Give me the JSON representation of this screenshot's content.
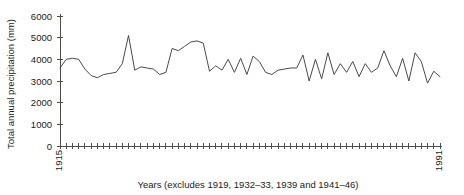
{
  "chart_data": {
    "type": "line",
    "title": "",
    "subtitle": "",
    "xlabel": "Years (excludes 1919, 1932–33, 1939 and 1941–46)",
    "ylabel": "Total annual precipitation (mm)",
    "ylim": [
      0,
      6000
    ],
    "yticks": [
      0,
      1000,
      2000,
      3000,
      4000,
      5000,
      6000
    ],
    "ytick_labels": [
      "0",
      "1000",
      "2000",
      "3000",
      "4000",
      "5000",
      "6000"
    ],
    "xlim_labels": [
      "1915",
      "1991"
    ],
    "x_start_label": "1915",
    "x_end_label": "1991",
    "grid": false,
    "legend": "none",
    "series_color": "#4a4a4a",
    "axis_color": "#4d4d4d",
    "n_points": 62,
    "x": [
      1915,
      1916,
      1917,
      1918,
      1920,
      1921,
      1922,
      1923,
      1924,
      1925,
      1926,
      1927,
      1928,
      1929,
      1930,
      1931,
      1934,
      1935,
      1936,
      1937,
      1938,
      1940,
      1947,
      1948,
      1949,
      1950,
      1951,
      1952,
      1953,
      1954,
      1955,
      1956,
      1957,
      1958,
      1959,
      1960,
      1961,
      1962,
      1963,
      1964,
      1965,
      1966,
      1967,
      1968,
      1969,
      1970,
      1971,
      1972,
      1973,
      1974,
      1975,
      1976,
      1977,
      1978,
      1979,
      1980,
      1981,
      1982,
      1983,
      1984,
      1985,
      1991
    ],
    "values": [
      3600,
      4000,
      4050,
      4000,
      3550,
      3250,
      3150,
      3300,
      3350,
      3400,
      3800,
      5100,
      3500,
      3650,
      3600,
      3550,
      3300,
      3400,
      4500,
      4400,
      4600,
      4800,
      4850,
      4750,
      3450,
      3700,
      3500,
      4000,
      3400,
      4050,
      3300,
      4150,
      3900,
      3400,
      3300,
      3500,
      3550,
      3600,
      3600,
      4200,
      3000,
      4000,
      3100,
      4300,
      3300,
      3800,
      3400,
      3900,
      3200,
      3800,
      3400,
      3600,
      4400,
      3700,
      3200,
      4050,
      3000,
      4300,
      3900,
      2900,
      3450,
      3200
    ]
  }
}
